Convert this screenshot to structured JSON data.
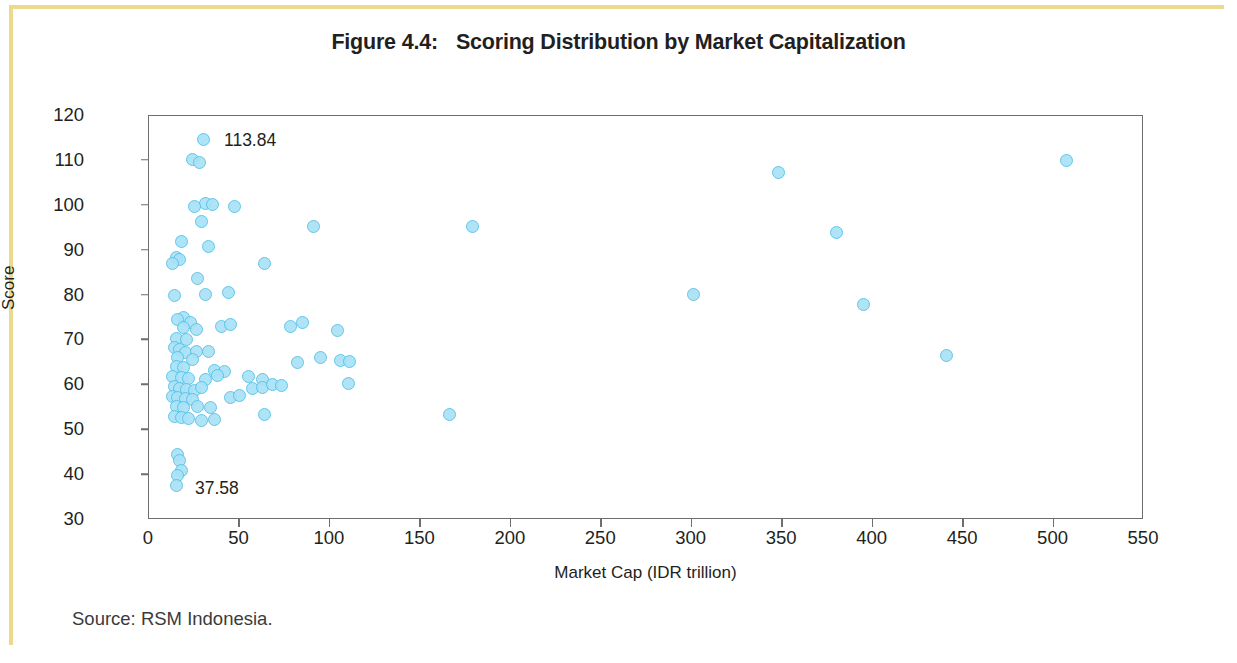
{
  "figure": {
    "number": "Figure 4.4:",
    "title": "Scoring Distribution by Market Capitalization"
  },
  "source_note": "Source: RSM Indonesia.",
  "colors": {
    "marker_fill": "#a9e2f7",
    "marker_edge": "#56c1e8",
    "axis": "#6d6e71",
    "text": "#231f20",
    "page_frame": "#ecd98c"
  },
  "chart_data": {
    "type": "scatter",
    "title": "Scoring Distribution by Market Capitalization",
    "xlabel": "Market Cap (IDR trillion)",
    "ylabel": "Score",
    "xlim": [
      0,
      550
    ],
    "ylim": [
      30,
      120
    ],
    "xticks": [
      0,
      50,
      100,
      150,
      200,
      250,
      300,
      350,
      400,
      450,
      500,
      550
    ],
    "yticks": [
      30,
      40,
      50,
      60,
      70,
      80,
      90,
      100,
      110,
      120
    ],
    "grid": false,
    "legend": null,
    "annotations": [
      {
        "text": "113.84",
        "x": 42,
        "y": 114.5
      },
      {
        "text": "37.58",
        "x": 26,
        "y": 36.8
      }
    ],
    "series": [
      {
        "name": "Companies",
        "points": [
          [
            30,
            114.8
          ],
          [
            24,
            110.3
          ],
          [
            28,
            109.6
          ],
          [
            31,
            100.6
          ],
          [
            35,
            100.3
          ],
          [
            25,
            99.8
          ],
          [
            47,
            99.8
          ],
          [
            29,
            96.6
          ],
          [
            18,
            92.0
          ],
          [
            33,
            91.0
          ],
          [
            15,
            88.4
          ],
          [
            17,
            88.0
          ],
          [
            13,
            87.2
          ],
          [
            64,
            87.1
          ],
          [
            27,
            83.8
          ],
          [
            14,
            80.1
          ],
          [
            31,
            80.2
          ],
          [
            44,
            80.7
          ],
          [
            19,
            75.1
          ],
          [
            16,
            74.6
          ],
          [
            23,
            73.9
          ],
          [
            19,
            72.8
          ],
          [
            26,
            72.5
          ],
          [
            40,
            73.1
          ],
          [
            45,
            73.5
          ],
          [
            78,
            73.0
          ],
          [
            85,
            74.0
          ],
          [
            104,
            72.2
          ],
          [
            15,
            70.4
          ],
          [
            21,
            70.2
          ],
          [
            14,
            68.5
          ],
          [
            17,
            68.0
          ],
          [
            20,
            67.4
          ],
          [
            26,
            67.6
          ],
          [
            33,
            67.5
          ],
          [
            16,
            66.1
          ],
          [
            24,
            65.8
          ],
          [
            95,
            66.3
          ],
          [
            106,
            65.5
          ],
          [
            111,
            65.3
          ],
          [
            15,
            64.2
          ],
          [
            19,
            63.9
          ],
          [
            36,
            63.4
          ],
          [
            42,
            63.0
          ],
          [
            13,
            61.9
          ],
          [
            18,
            61.7
          ],
          [
            22,
            61.5
          ],
          [
            31,
            61.4
          ],
          [
            38,
            62.2
          ],
          [
            55,
            62.0
          ],
          [
            63,
            61.2
          ],
          [
            82,
            65.0
          ],
          [
            110,
            60.5
          ],
          [
            14,
            59.8
          ],
          [
            17,
            59.4
          ],
          [
            21,
            59.0
          ],
          [
            25,
            58.8
          ],
          [
            29,
            59.6
          ],
          [
            57,
            59.2
          ],
          [
            63,
            59.5
          ],
          [
            68,
            60.2
          ],
          [
            73,
            60.0
          ],
          [
            13,
            57.6
          ],
          [
            16,
            57.3
          ],
          [
            20,
            57.0
          ],
          [
            24,
            56.9
          ],
          [
            45,
            57.3
          ],
          [
            50,
            57.8
          ],
          [
            15,
            55.3
          ],
          [
            19,
            55.0
          ],
          [
            27,
            55.2
          ],
          [
            34,
            55.0
          ],
          [
            14,
            53.0
          ],
          [
            18,
            52.8
          ],
          [
            22,
            52.6
          ],
          [
            29,
            52.1
          ],
          [
            36,
            52.3
          ],
          [
            64,
            53.4
          ],
          [
            166,
            53.6
          ],
          [
            16,
            44.6
          ],
          [
            17,
            43.2
          ],
          [
            18,
            41.0
          ],
          [
            16,
            39.9
          ],
          [
            15,
            37.6
          ],
          [
            91,
            95.4
          ],
          [
            179,
            95.3
          ],
          [
            301,
            80.3
          ],
          [
            348,
            107.5
          ],
          [
            380,
            94.0
          ],
          [
            395,
            77.9
          ],
          [
            441,
            66.6
          ],
          [
            507,
            110.0
          ]
        ]
      }
    ]
  }
}
